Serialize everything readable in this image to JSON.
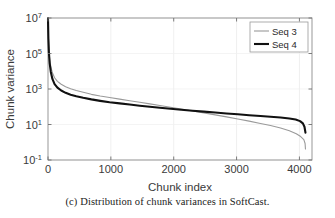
{
  "figure": {
    "caption": "(c) Distribution of chunk variances in SoftCast."
  },
  "chart_data": {
    "type": "line",
    "title": "",
    "xlabel": "Chunk index",
    "ylabel": "Chunk variance",
    "yscale": "log",
    "xscale": "linear",
    "xlim": [
      0,
      4200
    ],
    "ylim": [
      0.1,
      10000000
    ],
    "grid": true,
    "legend_position": "top-right",
    "xticks": [
      0,
      1000,
      2000,
      3000,
      4000
    ],
    "xtick_labels": [
      "0",
      "1000",
      "2000",
      "3000",
      "4000"
    ],
    "yticks": [
      0.1,
      10,
      1000,
      100000,
      10000000
    ],
    "ytick_labels": [
      {
        "mantissa": "10",
        "exponent": "-1"
      },
      {
        "mantissa": "10",
        "exponent": "1"
      },
      {
        "mantissa": "10",
        "exponent": "3"
      },
      {
        "mantissa": "10",
        "exponent": "5"
      },
      {
        "mantissa": "10",
        "exponent": "7"
      }
    ],
    "series": [
      {
        "name": "Seq 3",
        "color": "#9a9a9a",
        "width": 1.1,
        "x": [
          0,
          6,
          14,
          26,
          44,
          70,
          105,
          150,
          210,
          280,
          360,
          450,
          560,
          690,
          830,
          980,
          1140,
          1300,
          1460,
          1620,
          1780,
          1950,
          2120,
          2300,
          2480,
          2660,
          2840,
          3020,
          3200,
          3380,
          3540,
          3700,
          3840,
          3950,
          4020,
          4070,
          4090,
          4096
        ],
        "y": [
          9500000,
          900000,
          180000,
          52000,
          19000,
          8200,
          4300,
          2700,
          1850,
          1350,
          1030,
          820,
          650,
          500,
          400,
          330,
          270,
          220,
          180,
          145,
          118,
          94,
          74,
          58,
          45,
          35,
          27,
          20.5,
          15.5,
          11.5,
          8.8,
          6.4,
          4.4,
          3.0,
          2.1,
          1.4,
          0.85,
          0.42
        ]
      },
      {
        "name": "Seq 4",
        "color": "#111111",
        "width": 2.1,
        "x": [
          0,
          6,
          14,
          26,
          44,
          70,
          105,
          150,
          210,
          280,
          360,
          450,
          560,
          690,
          830,
          980,
          1140,
          1300,
          1460,
          1620,
          1780,
          1950,
          2120,
          2300,
          2480,
          2660,
          2840,
          3020,
          3200,
          3380,
          3540,
          3700,
          3840,
          3940,
          4010,
          4055,
          4080,
          4096
        ],
        "y": [
          9500000,
          700000,
          120000,
          30000,
          9500,
          3700,
          1900,
          1200,
          820,
          610,
          480,
          390,
          320,
          260,
          215,
          180,
          155,
          133,
          115,
          100,
          88,
          77,
          68,
          60,
          53,
          47,
          42,
          37.5,
          33.5,
          30,
          27.5,
          25,
          22,
          19,
          15.5,
          11.5,
          7.5,
          3.5
        ]
      }
    ]
  }
}
